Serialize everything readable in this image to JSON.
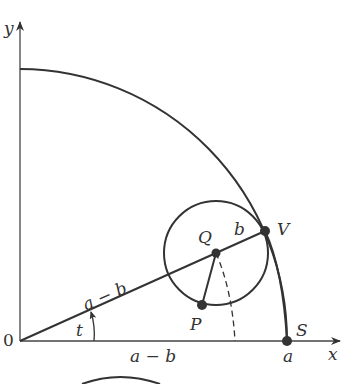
{
  "diagram": {
    "type": "hypocycloid construction",
    "colors": {
      "stroke": "#333333",
      "background": "#ffffff"
    },
    "axes": {
      "x_label": "x",
      "y_label": "y",
      "origin_label": "0"
    },
    "points": {
      "Q": "Q",
      "V": "V",
      "P": "P",
      "S": "S"
    },
    "labels": {
      "radius_small": "b",
      "segment_OQ": "a − b",
      "angle": "t",
      "x_projection": "a − b",
      "x_intercept": "a"
    }
  }
}
